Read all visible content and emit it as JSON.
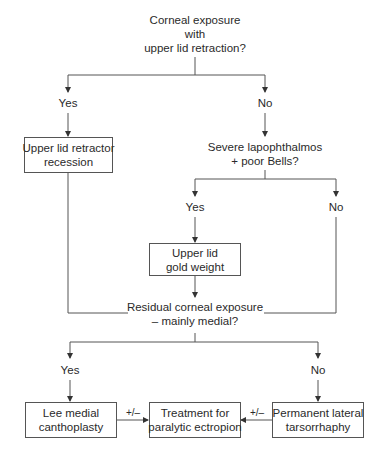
{
  "diagram": {
    "q1": {
      "lines": [
        "Corneal exposure",
        "with",
        "upper lid retraction?"
      ]
    },
    "q1_yes": "Yes",
    "q1_no": "No",
    "box_retractor": {
      "lines": [
        "Upper lid retractor",
        "recession"
      ]
    },
    "q2": {
      "lines": [
        "Severe lapophthalmos",
        "+ poor Bells?"
      ]
    },
    "q2_yes": "Yes",
    "q2_no": "No",
    "box_gold": {
      "lines": [
        "Upper lid",
        "gold weight"
      ]
    },
    "q3": {
      "lines": [
        "Residual corneal exposure",
        "– mainly medial?"
      ]
    },
    "q3_yes": "Yes",
    "q3_no": "No",
    "box_lee": {
      "lines": [
        "Lee medial",
        "canthoplasty"
      ]
    },
    "box_treatment": {
      "lines": [
        "Treatment for",
        "paralytic ectropion"
      ]
    },
    "box_tarsorrhaphy": {
      "lines": [
        "Permanent lateral",
        "tarsorrhaphy"
      ]
    },
    "edge_lee_treatment": "+/–",
    "edge_tarsorrhaphy_treatment": "+/–"
  }
}
